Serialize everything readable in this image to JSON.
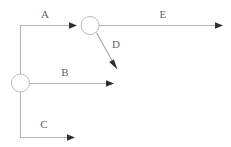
{
  "diagram": {
    "canvas": {
      "width": 231,
      "height": 147,
      "background": "#ffffff"
    },
    "colors": {
      "line": "#b3b3b3",
      "node_stroke": "#bdbdbd",
      "node_fill": "#ffffff",
      "arrow_head": "#2e2e2e",
      "label_text": "#666666"
    },
    "nodes": [
      {
        "id": "node-left",
        "name": "junction-node-left",
        "cx": 20,
        "cy": 83,
        "r": 9
      },
      {
        "id": "node-top",
        "name": "junction-node-top",
        "cx": 90,
        "cy": 25,
        "r": 9
      }
    ],
    "edges": [
      {
        "id": "edge-a",
        "label": "A",
        "label_x": 45,
        "label_y": 14,
        "kind": "horizontal",
        "from": "node-left",
        "to": "node-top"
      },
      {
        "id": "edge-b",
        "label": "B",
        "label_x": 65,
        "label_y": 72,
        "kind": "horizontal",
        "from": "node-left",
        "to": "open-end"
      },
      {
        "id": "edge-c",
        "label": "C",
        "label_x": 44,
        "label_y": 124,
        "kind": "horizontal",
        "from": "node-left",
        "to": "open-end"
      },
      {
        "id": "edge-d",
        "label": "D",
        "label_x": 115,
        "label_y": 44,
        "kind": "diagonal",
        "from": "node-top",
        "to": "open-end"
      },
      {
        "id": "edge-e",
        "label": "E",
        "label_x": 163,
        "label_y": 14,
        "kind": "horizontal",
        "from": "node-top",
        "to": "open-end"
      }
    ],
    "labels": {
      "a": "A",
      "b": "B",
      "c": "C",
      "d": "D",
      "e": "E"
    }
  }
}
